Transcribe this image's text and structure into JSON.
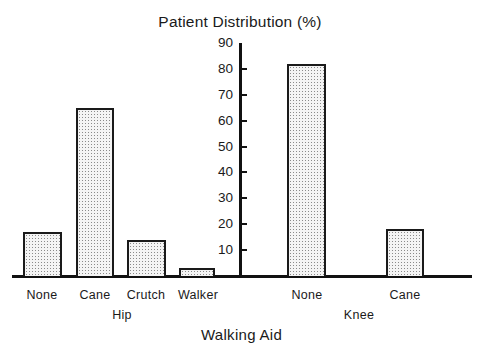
{
  "chart_data": {
    "type": "bar",
    "title": "Patient Distribution (%)",
    "xlabel": "Walking Aid",
    "ylabel": "Patient Distribution (%)",
    "ylim": [
      0,
      90
    ],
    "yticks": [
      10,
      20,
      30,
      40,
      50,
      60,
      70,
      80,
      90
    ],
    "grid": false,
    "legend": null,
    "groups": [
      {
        "name": "Hip",
        "categories": [
          "None",
          "Cane",
          "Crutch",
          "Walker"
        ],
        "values": [
          17,
          65,
          14,
          3
        ]
      },
      {
        "name": "Knee",
        "categories": [
          "None",
          "Cane"
        ],
        "values": [
          82,
          18
        ]
      }
    ],
    "categories": [
      "Hip None",
      "Hip Cane",
      "Hip Crutch",
      "Hip Walker",
      "Knee None",
      "Knee Cane"
    ],
    "values": [
      17,
      65,
      14,
      3,
      82,
      18
    ]
  },
  "labels": {
    "title": "Patient Distribution (%)",
    "xlabel": "Walking Aid",
    "yticks": [
      "10",
      "20",
      "30",
      "40",
      "50",
      "60",
      "70",
      "80",
      "90"
    ],
    "hip": "Hip",
    "knee": "Knee",
    "hip_cats": [
      "None",
      "Cane",
      "Crutch",
      "Walker"
    ],
    "knee_cats": [
      "None",
      "Cane"
    ]
  }
}
